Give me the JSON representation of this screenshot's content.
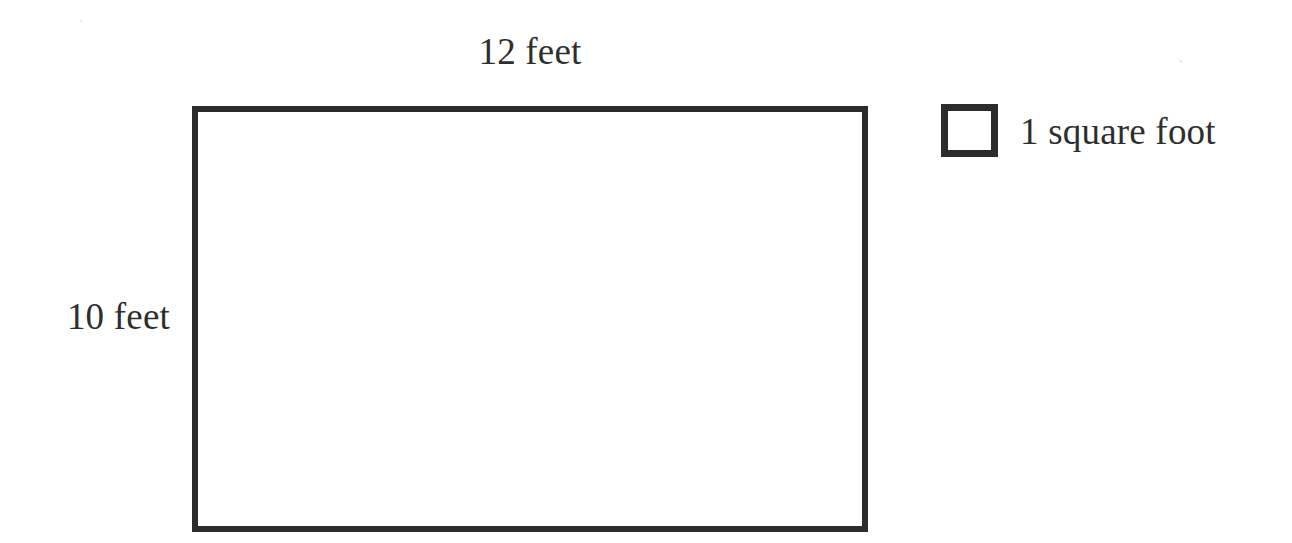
{
  "diagram": {
    "type": "labeled-rectangle-area-diagram",
    "background_color": "#ffffff",
    "stroke_color": "#2c2c2c",
    "text_color": "#2e2e2e",
    "shape": {
      "name": "room-rectangle",
      "width_label": "12 feet",
      "height_label": "10 feet",
      "width_value": 12,
      "height_value": 10,
      "units": "feet"
    },
    "legend": {
      "swatch_name": "unit-square-swatch",
      "label": "1 square foot"
    }
  }
}
